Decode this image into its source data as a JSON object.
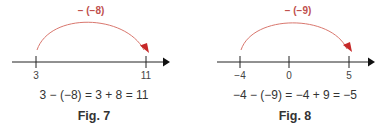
{
  "colors": {
    "arc": "#d9776e",
    "arrowhead": "#c62828",
    "op_label": "#c0504d",
    "axis": "#222222",
    "text": "#333333"
  },
  "figures": [
    {
      "caption": "Fig. 7",
      "operation_label": "− (−8)",
      "equation": "3 − (−8) = 3 + 8 = 11",
      "ticks": [
        {
          "label": "3"
        },
        {
          "label": "11"
        }
      ]
    },
    {
      "caption": "Fig. 8",
      "operation_label": "− (−9)",
      "equation": "−4 − (−9) = −4 + 9 = −5",
      "ticks": [
        {
          "label": "−4"
        },
        {
          "label": "0"
        },
        {
          "label": "5"
        }
      ]
    }
  ]
}
